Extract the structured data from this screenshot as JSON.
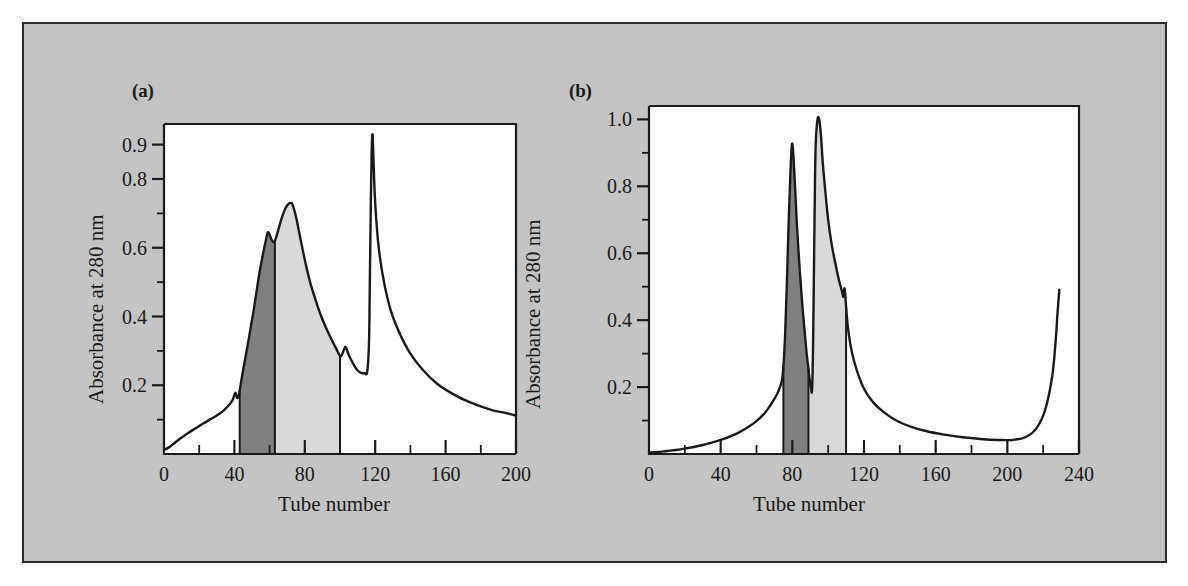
{
  "figure": {
    "background_color": "#c4c4c4",
    "border_color": "#2a2a2a",
    "plot_background": "#ffffff",
    "trace_color": "#1a1a1a",
    "fill_dark_color": "#808080",
    "fill_light_color": "#d9d9d9"
  },
  "chart_data": [
    {
      "type": "line",
      "panel_label": "(a)",
      "title": "",
      "xlabel": "Tube number",
      "ylabel": "Absorbance at 280 nm",
      "xlim": [
        0,
        200
      ],
      "ylim": [
        0,
        0.96
      ],
      "grid": false,
      "legend": "none",
      "x_ticks_major": [
        0,
        40,
        80,
        120,
        160,
        200
      ],
      "x_tick_labels": [
        "0",
        "40",
        "80",
        "120",
        "160",
        "200"
      ],
      "x_ticks_minor": [
        20,
        60,
        100,
        140,
        180
      ],
      "y_ticks_major": [
        0.2,
        0.4,
        0.6,
        0.8,
        0.9
      ],
      "y_tick_labels": [
        "0.2",
        "0.4",
        "0.6",
        "0.8",
        "0.9"
      ],
      "y_ticks_minor": [
        0.1,
        0.3,
        0.5,
        0.7
      ],
      "shaded_regions": [
        {
          "name": "dark-fraction",
          "color": "#808080",
          "x_start": 43,
          "x_end": 63
        },
        {
          "name": "light-fraction",
          "color": "#d9d9d9",
          "x_start": 63,
          "x_end": 100
        }
      ],
      "x": [
        0,
        3,
        6,
        10,
        14,
        18,
        22,
        26,
        30,
        34,
        37,
        39,
        40.5,
        41.5,
        42.5,
        43,
        45,
        48,
        51,
        54,
        56,
        58,
        59,
        60,
        61,
        62,
        63,
        64,
        65.5,
        67,
        69,
        71,
        72,
        73,
        75,
        77,
        80,
        83,
        86,
        89,
        92,
        95,
        98,
        100,
        101,
        102,
        103,
        104,
        105,
        106,
        108,
        110,
        112,
        114,
        115.5,
        116.5,
        117,
        117.5,
        118,
        118.5,
        119,
        120,
        122,
        125,
        129,
        134,
        140,
        147,
        155,
        164,
        174,
        185,
        195,
        200
      ],
      "y": [
        0.012,
        0.02,
        0.032,
        0.048,
        0.062,
        0.075,
        0.088,
        0.1,
        0.112,
        0.127,
        0.143,
        0.157,
        0.178,
        0.163,
        0.172,
        0.185,
        0.245,
        0.33,
        0.42,
        0.52,
        0.575,
        0.625,
        0.645,
        0.638,
        0.625,
        0.617,
        0.62,
        0.635,
        0.662,
        0.688,
        0.715,
        0.729,
        0.73,
        0.726,
        0.69,
        0.64,
        0.565,
        0.5,
        0.45,
        0.405,
        0.368,
        0.335,
        0.305,
        0.285,
        0.288,
        0.3,
        0.312,
        0.302,
        0.288,
        0.277,
        0.258,
        0.243,
        0.236,
        0.235,
        0.24,
        0.33,
        0.52,
        0.72,
        0.88,
        0.93,
        0.86,
        0.73,
        0.6,
        0.5,
        0.415,
        0.35,
        0.292,
        0.245,
        0.205,
        0.175,
        0.15,
        0.13,
        0.118,
        0.112
      ]
    },
    {
      "type": "line",
      "panel_label": "(b)",
      "title": "",
      "xlabel": "Tube number",
      "ylabel": "Absorbance at 280 nm",
      "xlim": [
        0,
        240
      ],
      "ylim": [
        0,
        1.04
      ],
      "grid": false,
      "legend": "none",
      "x_ticks_major": [
        0,
        40,
        80,
        120,
        160,
        200,
        240
      ],
      "x_tick_labels": [
        "0",
        "40",
        "80",
        "120",
        "160",
        "200",
        "240"
      ],
      "x_ticks_minor": [
        20,
        60,
        100,
        140,
        180,
        220
      ],
      "y_ticks_major": [
        0.2,
        0.4,
        0.6,
        0.8,
        1.0
      ],
      "y_tick_labels": [
        "0.2",
        "0.4",
        "0.6",
        "0.8",
        "1.0"
      ],
      "y_ticks_minor": [
        0.1,
        0.3,
        0.5,
        0.7,
        0.9
      ],
      "shaded_regions": [
        {
          "name": "dark-fraction",
          "color": "#808080",
          "x_start": 75,
          "x_end": 89
        },
        {
          "name": "light-fraction",
          "color": "#d9d9d9",
          "x_start": 89,
          "x_end": 110
        }
      ],
      "x": [
        0,
        5,
        10,
        15,
        20,
        25,
        30,
        35,
        40,
        45,
        50,
        54,
        58,
        62,
        65,
        68,
        70,
        72,
        74,
        75,
        76,
        77,
        78,
        79,
        79.8,
        80.5,
        81.5,
        82.5,
        84,
        85.5,
        87,
        88,
        89,
        89.5,
        90,
        90.5,
        91,
        91.5,
        92,
        92.5,
        93,
        94,
        95,
        96,
        97,
        98.5,
        100,
        102,
        104,
        106,
        107.5,
        108.5,
        109,
        109.5,
        110,
        111,
        113,
        116,
        120,
        125,
        131,
        138,
        146,
        155,
        165,
        175,
        185,
        195,
        203,
        210,
        216,
        221,
        225,
        227,
        228,
        229
      ],
      "y": [
        0.004,
        0.006,
        0.009,
        0.012,
        0.016,
        0.021,
        0.027,
        0.034,
        0.042,
        0.052,
        0.064,
        0.076,
        0.09,
        0.108,
        0.125,
        0.148,
        0.165,
        0.185,
        0.215,
        0.26,
        0.36,
        0.52,
        0.7,
        0.85,
        0.925,
        0.9,
        0.8,
        0.69,
        0.56,
        0.45,
        0.36,
        0.3,
        0.255,
        0.23,
        0.21,
        0.195,
        0.19,
        0.3,
        0.52,
        0.75,
        0.92,
        0.998,
        1.0,
        0.95,
        0.87,
        0.78,
        0.7,
        0.625,
        0.57,
        0.52,
        0.49,
        0.47,
        0.495,
        0.48,
        0.44,
        0.38,
        0.31,
        0.25,
        0.195,
        0.155,
        0.125,
        0.1,
        0.082,
        0.068,
        0.058,
        0.05,
        0.045,
        0.042,
        0.042,
        0.05,
        0.075,
        0.13,
        0.23,
        0.34,
        0.42,
        0.49
      ]
    }
  ]
}
